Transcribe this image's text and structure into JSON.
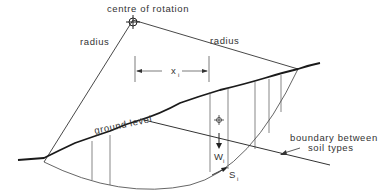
{
  "diagram": {
    "labels": {
      "centre": "centre of rotation",
      "radius_left": "radius",
      "radius_right": "radius",
      "x_main": "x",
      "x_sub": "i",
      "ground": "ground level",
      "boundary_line1": "boundary between",
      "boundary_line2": "soil types",
      "w_main": "W",
      "w_sub": "i",
      "s_main": "S",
      "s_sub": "i"
    },
    "colors": {
      "ink": "#222222",
      "thin": "#555555",
      "background": "#ffffff"
    },
    "geometry": {
      "centre": [
        133,
        20
      ],
      "left_toe": [
        44,
        162
      ],
      "right_crest": [
        298,
        69
      ]
    }
  }
}
